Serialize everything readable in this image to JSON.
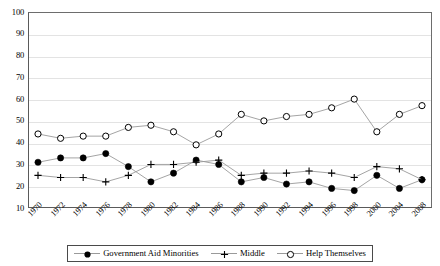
{
  "chart_data": {
    "type": "line",
    "title": "",
    "xlabel": "",
    "ylabel": "",
    "ylim": [
      10,
      100
    ],
    "ytick_step": 10,
    "yticks": [
      100,
      90,
      80,
      70,
      60,
      50,
      40,
      30,
      20,
      10
    ],
    "grid": true,
    "legend_position": "bottom",
    "categories": [
      "1970",
      "1972",
      "1974",
      "1976",
      "1978",
      "1980",
      "1982",
      "1984",
      "1986",
      "1988",
      "1990",
      "1992",
      "1994",
      "1996",
      "1998",
      "2000",
      "2004",
      "2008"
    ],
    "series": [
      {
        "name": "Government Aid Minorities",
        "marker": "filled-circle",
        "color": "#000000",
        "line_color": "#9a9a9a",
        "values": [
          31,
          33,
          33,
          35,
          29,
          22,
          26,
          32,
          30,
          22,
          24,
          21,
          22,
          19,
          18,
          25,
          19,
          23
        ]
      },
      {
        "name": "Middle",
        "marker": "plus",
        "color": "#000000",
        "line_color": "#9a9a9a",
        "values": [
          25,
          24,
          24,
          22,
          25,
          30,
          30,
          31,
          32,
          25,
          26,
          26,
          27,
          26,
          24,
          29,
          28,
          23
        ]
      },
      {
        "name": "Help Themselves",
        "marker": "open-circle",
        "color": "#000000",
        "line_color": "#9a9a9a",
        "values": [
          44,
          42,
          43,
          43,
          47,
          48,
          45,
          39,
          44,
          53,
          50,
          52,
          53,
          56,
          60,
          45,
          53,
          57
        ]
      }
    ]
  },
  "legend": {
    "items": [
      {
        "label": "Government Aid Minorities",
        "marker": "filled-circle"
      },
      {
        "label": "Middle",
        "marker": "plus"
      },
      {
        "label": "Help Themselves",
        "marker": "open-circle"
      }
    ]
  }
}
